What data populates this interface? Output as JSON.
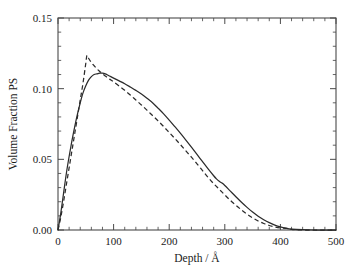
{
  "chart_data": {
    "type": "line",
    "title": "",
    "xlabel": "Depth / Å",
    "ylabel": "Volume Fraction PS",
    "xlim": [
      0,
      500
    ],
    "ylim": [
      0.0,
      0.15
    ],
    "grid": false,
    "legend": "none",
    "x_major_ticks": [
      0,
      100,
      200,
      300,
      400,
      500
    ],
    "x_tick_labels": [
      "0",
      "100",
      "200",
      "300",
      "400",
      "500"
    ],
    "x_minor_step": 20,
    "y_major_ticks": [
      0.0,
      0.05,
      0.1,
      0.15
    ],
    "y_tick_labels": [
      "0.00",
      "0.05",
      "0.10",
      "0.15"
    ],
    "y_minor_step": 0.01,
    "frame": "full-box",
    "ticks_direction": "in",
    "ticks_on_all_sides": true,
    "series": [
      {
        "name": "solid-curve",
        "style": "solid",
        "color": "#2b2b2b",
        "x": [
          0,
          5,
          10,
          15,
          20,
          25,
          30,
          35,
          40,
          45,
          50,
          55,
          60,
          65,
          70,
          75,
          80,
          85,
          90,
          95,
          100,
          110,
          120,
          130,
          140,
          150,
          160,
          170,
          180,
          190,
          200,
          210,
          220,
          230,
          240,
          250,
          260,
          270,
          280,
          285,
          290,
          295,
          300,
          310,
          320,
          330,
          340,
          350,
          360,
          370,
          380,
          390,
          400,
          410,
          420,
          440,
          460,
          480,
          500
        ],
        "y": [
          0.0,
          0.012,
          0.026,
          0.04,
          0.052,
          0.063,
          0.073,
          0.082,
          0.09,
          0.097,
          0.102,
          0.106,
          0.1085,
          0.11,
          0.1105,
          0.111,
          0.111,
          0.1105,
          0.1095,
          0.1085,
          0.1075,
          0.1055,
          0.1035,
          0.1012,
          0.0988,
          0.0962,
          0.0932,
          0.09,
          0.0862,
          0.0822,
          0.0778,
          0.0732,
          0.0685,
          0.0636,
          0.0586,
          0.0535,
          0.0483,
          0.0432,
          0.0384,
          0.0362,
          0.0345,
          0.0332,
          0.0315,
          0.0275,
          0.0235,
          0.0196,
          0.016,
          0.0127,
          0.0098,
          0.0073,
          0.0052,
          0.0035,
          0.0022,
          0.0013,
          0.0007,
          0.0002,
          0.0,
          0.0,
          0.0
        ]
      },
      {
        "name": "dashed-curve",
        "style": "dashed",
        "color": "#2b2b2b",
        "x": [
          0,
          5,
          10,
          15,
          20,
          25,
          30,
          35,
          40,
          45,
          50,
          52,
          55,
          60,
          65,
          70,
          75,
          80,
          85,
          90,
          95,
          100,
          110,
          120,
          130,
          140,
          150,
          160,
          170,
          180,
          190,
          200,
          210,
          220,
          230,
          240,
          250,
          260,
          270,
          280,
          290,
          300,
          310,
          320,
          330,
          340,
          350,
          360,
          370,
          380,
          390,
          400,
          410,
          415,
          420,
          440,
          460,
          480,
          500
        ],
        "y": [
          0.0,
          0.009,
          0.02,
          0.032,
          0.044,
          0.056,
          0.068,
          0.08,
          0.092,
          0.104,
          0.118,
          0.1235,
          0.1215,
          0.1185,
          0.1162,
          0.114,
          0.1122,
          0.1105,
          0.109,
          0.1075,
          0.1062,
          0.1048,
          0.1018,
          0.0988,
          0.0955,
          0.092,
          0.0885,
          0.0848,
          0.081,
          0.0772,
          0.0732,
          0.069,
          0.0648,
          0.0605,
          0.056,
          0.0515,
          0.0468,
          0.042,
          0.0372,
          0.0328,
          0.0288,
          0.0248,
          0.021,
          0.0175,
          0.0142,
          0.0112,
          0.0086,
          0.0064,
          0.0046,
          0.0032,
          0.0022,
          0.0015,
          0.0012,
          0.0012,
          0.0005,
          0.0,
          0.0,
          0.0,
          0.0
        ]
      }
    ],
    "annotations": [
      {
        "text": "solid curve broad maximum ≈ 0.111 near 78 Å"
      },
      {
        "text": "dashed curve sharp maximum ≈ 0.1235 near 52 Å"
      },
      {
        "text": "curves cross near 95–100 Å and again near 400 Å"
      }
    ]
  },
  "axes": {
    "x_title": "Depth / Å",
    "y_title": "Volume Fraction PS",
    "x_labels": [
      "0",
      "100",
      "200",
      "300",
      "400",
      "500"
    ],
    "y_labels": [
      "0.00",
      "0.05",
      "0.10",
      "0.15"
    ]
  }
}
